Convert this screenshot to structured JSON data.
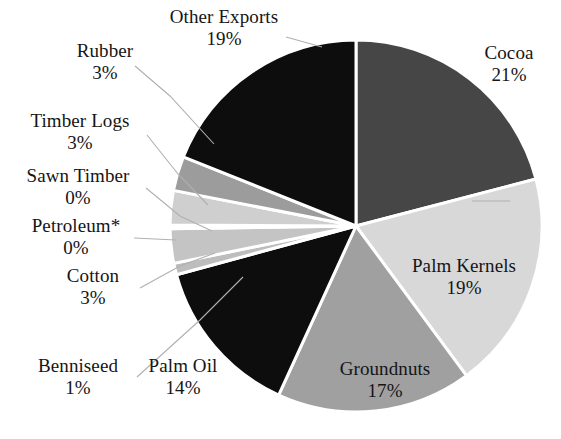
{
  "chart_data": {
    "type": "pie",
    "title": "",
    "subtitle": "",
    "xlabel": "",
    "ylabel": "",
    "legend_position": "callout-labels",
    "grid": false,
    "units": "percent",
    "start_angle_deg": 0,
    "direction": "clockwise",
    "categories": [
      "Cocoa",
      "Palm Kernels",
      "Groundnuts",
      "Palm Oil",
      "Benniseed",
      "Cotton",
      "Petroleum*",
      "Sawn Timber",
      "Timber Logs",
      "Rubber",
      "Other Exports"
    ],
    "values": [
      21,
      19,
      17,
      14,
      1,
      3,
      0,
      0,
      3,
      3,
      19
    ],
    "slices": [
      {
        "label": "Cocoa",
        "value": 21,
        "display": "21%",
        "color": "#464646",
        "label_name": "Cocoa",
        "label_pct": "21%"
      },
      {
        "label": "Palm Kernels",
        "value": 19,
        "display": "19%",
        "color": "#d8d8d8",
        "label_name": "Palm Kernels",
        "label_pct": "19%"
      },
      {
        "label": "Groundnuts",
        "value": 17,
        "display": "17%",
        "color": "#a0a0a0",
        "label_name": "Groundnuts",
        "label_pct": "17%"
      },
      {
        "label": "Palm Oil",
        "value": 14,
        "display": "14%",
        "color": "#0d0d0d",
        "label_name": "Palm Oil",
        "label_pct": "14%"
      },
      {
        "label": "Benniseed",
        "value": 1,
        "display": "1%",
        "color": "#bdbdbd",
        "label_name": "Benniseed",
        "label_pct": "1%"
      },
      {
        "label": "Cotton",
        "value": 3,
        "display": "3%",
        "color": "#c4c4c4",
        "label_name": "Cotton",
        "label_pct": "3%"
      },
      {
        "label": "Petroleum*",
        "value": 0,
        "display": "0%",
        "color": "#2a2a2a",
        "label_name": "Petroleum*",
        "label_pct": "0%"
      },
      {
        "label": "Sawn Timber",
        "value": 0,
        "display": "0%",
        "color": "#7a7a7a",
        "label_name": "Sawn Timber",
        "label_pct": "0%"
      },
      {
        "label": "Timber Logs",
        "value": 3,
        "display": "3%",
        "color": "#cfcfcf",
        "label_name": "Timber Logs",
        "label_pct": "3%"
      },
      {
        "label": "Rubber",
        "value": 3,
        "display": "3%",
        "color": "#9c9c9c",
        "label_name": "Rubber",
        "label_pct": "3%"
      },
      {
        "label": "Other Exports",
        "value": 19,
        "display": "19%",
        "color": "#0d0d0d",
        "label_name": "Other Exports",
        "label_pct": "19%"
      }
    ],
    "colors": {
      "background": "#ffffff",
      "slice_divider": "#ffffff",
      "leader_line": "#b0b0b0",
      "text": "#151515"
    }
  }
}
